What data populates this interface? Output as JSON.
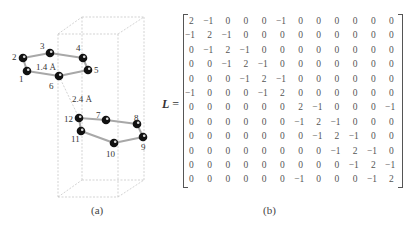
{
  "panel_a": {
    "caption": "(a)",
    "bond_length_label": "1.4 Å",
    "interlayer_distance_label": "2.4 Å",
    "atoms": [
      {
        "id": "1",
        "x": 27,
        "y": 71,
        "lx": 19,
        "ly": 82
      },
      {
        "id": "2",
        "x": 23,
        "y": 58,
        "lx": 12,
        "ly": 60
      },
      {
        "id": "3",
        "x": 50,
        "y": 53,
        "lx": 40,
        "ly": 49
      },
      {
        "id": "4",
        "x": 83,
        "y": 58,
        "lx": 76,
        "ly": 51
      },
      {
        "id": "5",
        "x": 88,
        "y": 70,
        "lx": 94,
        "ly": 73
      },
      {
        "id": "6",
        "x": 59,
        "y": 76,
        "lx": 49,
        "ly": 89
      },
      {
        "id": "7",
        "x": 106,
        "y": 120,
        "lx": 96,
        "ly": 118
      },
      {
        "id": "8",
        "x": 137,
        "y": 124,
        "lx": 134,
        "ly": 121
      },
      {
        "id": "9",
        "x": 143,
        "y": 137,
        "lx": 141,
        "ly": 150
      },
      {
        "id": "10",
        "x": 114,
        "y": 143,
        "lx": 106,
        "ly": 157
      },
      {
        "id": "11",
        "x": 81,
        "y": 131,
        "lx": 71,
        "ly": 142
      },
      {
        "id": "12",
        "x": 79,
        "y": 118,
        "lx": 64,
        "ly": 122
      }
    ],
    "bonds": [
      [
        1,
        2
      ],
      [
        2,
        3
      ],
      [
        3,
        4
      ],
      [
        4,
        5
      ],
      [
        5,
        6
      ],
      [
        6,
        1
      ],
      [
        7,
        8
      ],
      [
        8,
        9
      ],
      [
        9,
        10
      ],
      [
        10,
        11
      ],
      [
        11,
        12
      ],
      [
        12,
        7
      ]
    ]
  },
  "panel_b": {
    "caption": "(b)",
    "matrix_symbol": "L",
    "equals": " =",
    "matrix": [
      [
        "2",
        "−1",
        "0",
        "0",
        "0",
        "−1",
        "0",
        "0",
        "0",
        "0",
        "0",
        "0"
      ],
      [
        "−1",
        "2",
        "−1",
        "0",
        "0",
        "0",
        "0",
        "0",
        "0",
        "0",
        "0",
        "0"
      ],
      [
        "0",
        "−1",
        "2",
        "−1",
        "0",
        "0",
        "0",
        "0",
        "0",
        "0",
        "0",
        "0"
      ],
      [
        "0",
        "0",
        "−1",
        "2",
        "−1",
        "0",
        "0",
        "0",
        "0",
        "0",
        "0",
        "0"
      ],
      [
        "0",
        "0",
        "0",
        "−1",
        "2",
        "−1",
        "0",
        "0",
        "0",
        "0",
        "0",
        "0"
      ],
      [
        "−1",
        "0",
        "0",
        "0",
        "−1",
        "2",
        "0",
        "0",
        "0",
        "0",
        "0",
        "0"
      ],
      [
        "0",
        "0",
        "0",
        "0",
        "0",
        "0",
        "2",
        "−1",
        "0",
        "0",
        "0",
        "−1"
      ],
      [
        "0",
        "0",
        "0",
        "0",
        "0",
        "0",
        "−1",
        "2",
        "−1",
        "0",
        "0",
        "0"
      ],
      [
        "0",
        "0",
        "0",
        "0",
        "0",
        "0",
        "0",
        "−1",
        "2",
        "−1",
        "0",
        "0"
      ],
      [
        "0",
        "0",
        "0",
        "0",
        "0",
        "0",
        "0",
        "0",
        "−1",
        "2",
        "−1",
        "0"
      ],
      [
        "0",
        "0",
        "0",
        "0",
        "0",
        "0",
        "0",
        "0",
        "0",
        "−1",
        "2",
        "−1"
      ],
      [
        "0",
        "0",
        "0",
        "0",
        "0",
        "0",
        "−1",
        "0",
        "0",
        "0",
        "−1",
        "2"
      ]
    ]
  }
}
